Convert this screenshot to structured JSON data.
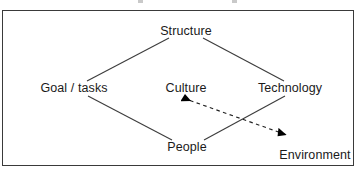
{
  "figure": {
    "kind": "leavitt-diamond-diagram",
    "background_color": "#ffffff",
    "frame_color": "#3a3a3a",
    "line_color": "#3d3d3d",
    "text_color": "#1a1a1a",
    "arrow_color": "#000000"
  },
  "nodes": [
    {
      "id": "structure",
      "label": "Structure",
      "x": 186,
      "y": 31
    },
    {
      "id": "goal_tasks",
      "label": "Goal / tasks",
      "x": 74,
      "y": 88
    },
    {
      "id": "culture",
      "label": "Culture",
      "x": 186,
      "y": 88
    },
    {
      "id": "technology",
      "label": "Technology",
      "x": 290,
      "y": 88
    },
    {
      "id": "people",
      "label": "People",
      "x": 187,
      "y": 147
    },
    {
      "id": "environment",
      "label": "Environment",
      "x": 315,
      "y": 155
    }
  ],
  "edges": [
    {
      "id": "goal-structure",
      "from": "goal_tasks",
      "to": "structure",
      "style": "solid",
      "arrow": "none",
      "x1": 87,
      "y1": 81,
      "x2": 169,
      "y2": 38
    },
    {
      "id": "structure-technology",
      "from": "structure",
      "to": "technology",
      "style": "solid",
      "arrow": "none",
      "x1": 203,
      "y1": 38,
      "x2": 284,
      "y2": 81
    },
    {
      "id": "goal-people",
      "from": "goal_tasks",
      "to": "people",
      "style": "solid",
      "arrow": "none",
      "x1": 88,
      "y1": 96,
      "x2": 172,
      "y2": 140
    },
    {
      "id": "technology-people",
      "from": "technology",
      "to": "people",
      "style": "solid",
      "arrow": "none",
      "x1": 285,
      "y1": 96,
      "x2": 204,
      "y2": 140
    },
    {
      "id": "culture-environment",
      "from": "culture",
      "to": "environment",
      "style": "dashed",
      "arrow": "both",
      "x1": 186,
      "y1": 99,
      "x2": 289,
      "y2": 136
    }
  ],
  "arrowheads": [
    {
      "id": "arrowhead-to-culture",
      "points_to": "culture",
      "x": 186,
      "y": 99,
      "direction": "up-left"
    },
    {
      "id": "arrowhead-to-environment",
      "points_to": "environment",
      "x": 289,
      "y": 136,
      "direction": "down-right"
    }
  ]
}
